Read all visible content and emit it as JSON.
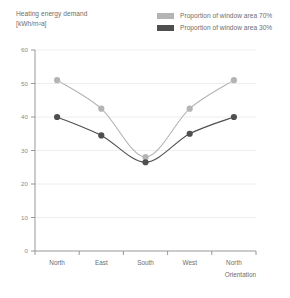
{
  "chart": {
    "title_line1": "Heating energy demand",
    "title_line2": "[kWh/m²a]"
  },
  "legend": {
    "items": [
      {
        "label": "Proportion of window area 70%",
        "color": "#b4b4b4"
      },
      {
        "label": "Proportion of window area 30%",
        "color": "#4f4f4f"
      }
    ]
  },
  "chart_data": {
    "type": "line",
    "title": "Heating energy demand [kWh/m²a]",
    "xlabel": "Orientation",
    "ylabel": "Heating energy demand [kWh/m²a]",
    "categories": [
      "North",
      "East",
      "South",
      "West",
      "North"
    ],
    "yticks": [
      0,
      10,
      20,
      30,
      40,
      50,
      60
    ],
    "ylim": [
      0,
      60
    ],
    "grid": true,
    "legend_position": "top-right",
    "series": [
      {
        "name": "Proportion of window area 70%",
        "color": "#b4b4b4",
        "values": [
          51,
          42.5,
          28,
          42.5,
          51
        ]
      },
      {
        "name": "Proportion of window area 30%",
        "color": "#4f4f4f",
        "values": [
          40,
          34.5,
          26.5,
          35,
          40
        ]
      }
    ]
  }
}
